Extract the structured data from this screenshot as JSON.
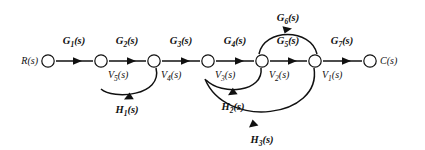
{
  "diagram": {
    "type": "signal-flow-graph",
    "title": "",
    "background_color": "#ffffff",
    "line_color": "#111111",
    "nodes": [
      {
        "id": "R",
        "label": "R(s)",
        "label_side": "left",
        "x": 48,
        "y": 61
      },
      {
        "id": "V5",
        "label": "V5(s)",
        "label_side": "right",
        "x": 101,
        "y": 61
      },
      {
        "id": "V4",
        "label": "V4(s)",
        "label_side": "right",
        "x": 154,
        "y": 61
      },
      {
        "id": "V3",
        "label": "V3(s)",
        "label_side": "right",
        "x": 208,
        "y": 61
      },
      {
        "id": "V2",
        "label": "V2(s)",
        "label_side": "right",
        "x": 262,
        "y": 61
      },
      {
        "id": "V1",
        "label": "V1(s)",
        "label_side": "right",
        "x": 315,
        "y": 61
      },
      {
        "id": "C",
        "label": "C(s)",
        "label_side": "right",
        "x": 370,
        "y": 61
      }
    ],
    "forward_branches": [
      {
        "gain": "G1(s)",
        "from": "R",
        "to": "V5",
        "label_x": 74,
        "label_y": 44
      },
      {
        "gain": "G2(s)",
        "from": "V5",
        "to": "V4",
        "label_x": 127,
        "label_y": 44
      },
      {
        "gain": "G3(s)",
        "from": "V4",
        "to": "V3",
        "label_x": 181,
        "label_y": 44
      },
      {
        "gain": "G4(s)",
        "from": "V3",
        "to": "V2",
        "label_x": 235,
        "label_y": 44
      },
      {
        "gain": "G5(s)",
        "from": "V2",
        "to": "V1",
        "label_x": 288,
        "label_y": 44
      },
      {
        "gain": "G7(s)",
        "from": "V1",
        "to": "C",
        "label_x": 342,
        "label_y": 44
      }
    ],
    "arc_branches": [
      {
        "gain": "G6(s)",
        "from": "V2",
        "to": "V1",
        "direction": "above",
        "label_x": 288,
        "label_y": 21
      },
      {
        "gain": "H1(s)",
        "from": "V4",
        "to": "V5",
        "direction": "below",
        "label_x": 127,
        "label_y": 103
      },
      {
        "gain": "H2(s)",
        "from": "V2",
        "to": "V3",
        "direction": "below",
        "label_x": 231,
        "label_y": 100
      },
      {
        "gain": "H3(s)",
        "from": "V1",
        "to": "V3",
        "direction": "below",
        "label_x": 262,
        "label_y": 135
      }
    ],
    "node_labels": {
      "R": {
        "text": "R(s)",
        "x": 22,
        "y": 64
      },
      "V5": {
        "text": "V5(s)",
        "x": 108,
        "y": 76
      },
      "V4": {
        "text": "V4(s)",
        "x": 161,
        "y": 76
      },
      "V3": {
        "text": "V3(s)",
        "x": 215,
        "y": 76
      },
      "V2": {
        "text": "V2(s)",
        "x": 269,
        "y": 76
      },
      "V1": {
        "text": "V1(s)",
        "x": 322,
        "y": 76
      },
      "C": {
        "text": "C(s)",
        "x": 381,
        "y": 64
      }
    }
  }
}
